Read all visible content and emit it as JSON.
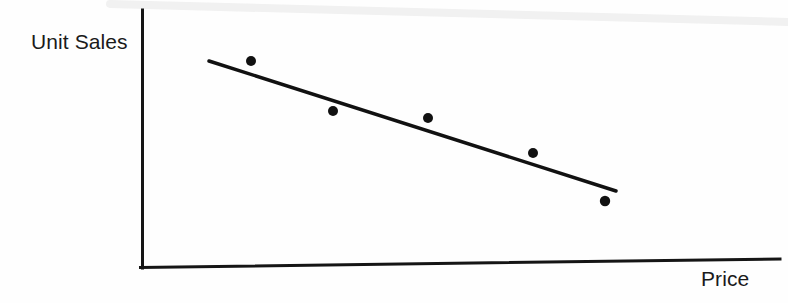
{
  "figure": {
    "width": 788,
    "height": 303,
    "background_color": "#fefefe",
    "ink_color": "#1a1a1a"
  },
  "labels": {
    "y_axis": "Unit Sales",
    "x_axis": "Price"
  },
  "chart_data": {
    "type": "scatter",
    "title": "",
    "subtitle": "",
    "xlabel": "Price",
    "ylabel": "Unit Sales",
    "grid": false,
    "legend": null,
    "axis_ticks": {
      "x": [],
      "y": []
    },
    "axes_style": "open-corner",
    "relationship": "negative",
    "series": [
      {
        "name": "Observations",
        "type": "scatter",
        "marker": "filled-circle",
        "marker_size_px": 10,
        "color": "#111111",
        "points": [
          {
            "x": 1,
            "y": 5.0
          },
          {
            "x": 2,
            "y": 3.9
          },
          {
            "x": 3,
            "y": 3.7
          },
          {
            "x": 4,
            "y": 2.9
          },
          {
            "x": 5,
            "y": 1.9
          }
        ]
      },
      {
        "name": "Trend line",
        "type": "line",
        "color": "#111111",
        "points": [
          {
            "x": 0.5,
            "y": 5.0
          },
          {
            "x": 5.3,
            "y": 2.2
          }
        ]
      }
    ],
    "xlim": [
      0,
      6.5
    ],
    "ylim": [
      0,
      5.6
    ]
  },
  "geometry": {
    "y_axis": {
      "x": 142,
      "y_top": 10,
      "y_bottom": 268,
      "stroke": 3
    },
    "x_axis": {
      "x_start": 142,
      "y_start": 268,
      "x_end": 780,
      "y_end": 259,
      "stroke": 3
    },
    "trend_line": {
      "x1": 209,
      "y1": 61,
      "x2": 616,
      "y2": 191,
      "stroke": 3.5
    },
    "points_px": [
      {
        "cx": 251,
        "cy": 61,
        "r": 5.0
      },
      {
        "cx": 333,
        "cy": 111,
        "r": 5.0
      },
      {
        "cx": 428,
        "cy": 118,
        "r": 5.0
      },
      {
        "cx": 533,
        "cy": 153,
        "r": 5.0
      },
      {
        "cx": 605,
        "cy": 201,
        "r": 5.2
      }
    ],
    "scan_artifact": {
      "x1": 110,
      "y1": 4,
      "x2": 788,
      "y2": 22
    }
  }
}
